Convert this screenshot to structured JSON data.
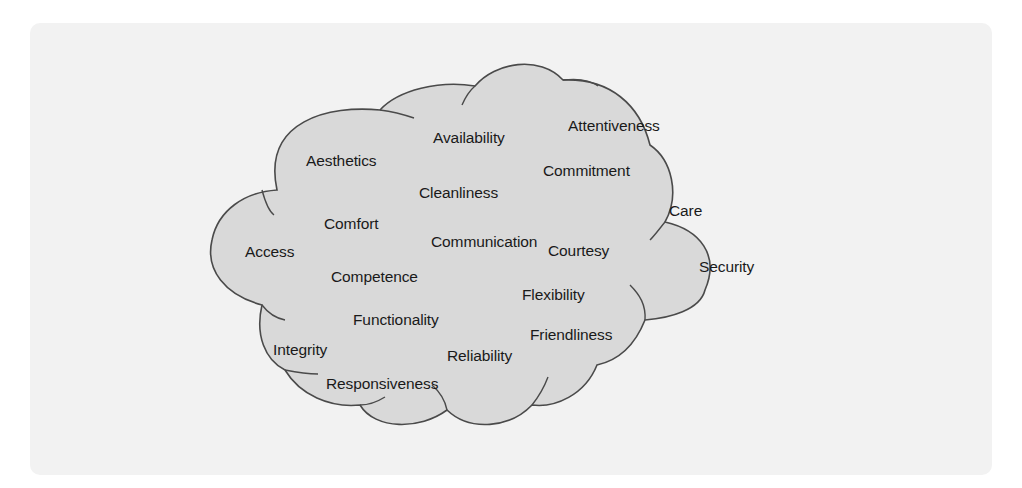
{
  "diagram": {
    "type": "cloud",
    "colors": {
      "background_panel": "#f2f2f2",
      "cloud_fill": "#d9d9d9",
      "cloud_stroke": "#4a4a4a",
      "text": "#1a1a1a"
    },
    "labels": [
      {
        "text": "Availability",
        "x": 433,
        "y": 129
      },
      {
        "text": "Attentiveness",
        "x": 568,
        "y": 117
      },
      {
        "text": "Aesthetics",
        "x": 306,
        "y": 152
      },
      {
        "text": "Commitment",
        "x": 543,
        "y": 162
      },
      {
        "text": "Cleanliness",
        "x": 419,
        "y": 184
      },
      {
        "text": "Care",
        "x": 669,
        "y": 202
      },
      {
        "text": "Comfort",
        "x": 324,
        "y": 215
      },
      {
        "text": "Communication",
        "x": 431,
        "y": 233
      },
      {
        "text": "Courtesy",
        "x": 548,
        "y": 242
      },
      {
        "text": "Access",
        "x": 245,
        "y": 243
      },
      {
        "text": "Security",
        "x": 699,
        "y": 258
      },
      {
        "text": "Competence",
        "x": 331,
        "y": 268
      },
      {
        "text": "Flexibility",
        "x": 522,
        "y": 286
      },
      {
        "text": "Functionality",
        "x": 353,
        "y": 311
      },
      {
        "text": "Friendliness",
        "x": 530,
        "y": 326
      },
      {
        "text": "Integrity",
        "x": 273,
        "y": 341
      },
      {
        "text": "Reliability",
        "x": 447,
        "y": 347
      },
      {
        "text": "Responsiveness",
        "x": 326,
        "y": 375
      }
    ]
  }
}
